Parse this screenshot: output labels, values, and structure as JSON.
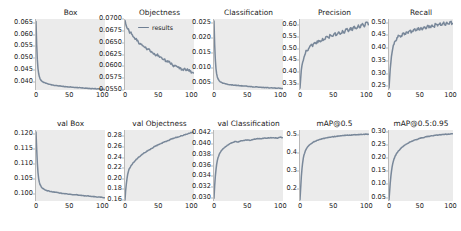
{
  "figure": {
    "rows": 2,
    "cols": 5,
    "background": "#ffffff",
    "axes_background": "#ebebeb",
    "line_color": "#6f7f93",
    "legend": {
      "label": "results",
      "panel": "Objectness"
    }
  },
  "chart_data": [
    {
      "type": "line",
      "title": "Box",
      "xlabel": "",
      "ylabel": "",
      "xlim": [
        0,
        104
      ],
      "ylim": [
        0.0368,
        0.0665
      ],
      "xticks": [
        0,
        50,
        100
      ],
      "yticks": [
        0.04,
        0.045,
        0.05,
        0.055,
        0.06,
        0.065
      ],
      "ytick_labels": [
        "0.040",
        "0.045",
        "0.050",
        "0.055",
        "0.060",
        "0.065"
      ],
      "grid": false,
      "legend_position": "none",
      "series": [
        {
          "name": "results",
          "x": [
            0,
            1,
            2,
            3,
            4,
            5,
            6,
            8,
            10,
            12,
            15,
            20,
            25,
            30,
            35,
            40,
            45,
            50,
            55,
            60,
            65,
            70,
            75,
            80,
            85,
            90,
            95,
            100,
            103
          ],
          "values": [
            0.0655,
            0.056,
            0.0495,
            0.0458,
            0.0437,
            0.0424,
            0.0416,
            0.0407,
            0.0402,
            0.0399,
            0.0396,
            0.0392,
            0.0389,
            0.0387,
            0.0385,
            0.0383,
            0.0382,
            0.0381,
            0.038,
            0.0379,
            0.0378,
            0.0377,
            0.0376,
            0.0375,
            0.0374,
            0.0373,
            0.0372,
            0.0371,
            0.037
          ]
        }
      ]
    },
    {
      "type": "line",
      "title": "Objectness",
      "xlabel": "",
      "ylabel": "",
      "xlim": [
        0,
        104
      ],
      "ylim": [
        0.055,
        0.07
      ],
      "xticks": [
        0,
        50,
        100
      ],
      "yticks": [
        0.055,
        0.0575,
        0.06,
        0.0625,
        0.065,
        0.0675,
        0.07
      ],
      "ytick_labels": [
        "0.0550",
        "0.0575",
        "0.0600",
        "0.0625",
        "0.0650",
        "0.0675",
        "0.0700"
      ],
      "grid": false,
      "legend_position": "upper right",
      "series": [
        {
          "name": "results",
          "x": [
            0,
            2,
            4,
            6,
            8,
            10,
            12,
            14,
            16,
            18,
            20,
            23,
            26,
            29,
            32,
            35,
            38,
            41,
            44,
            47,
            50,
            53,
            56,
            59,
            62,
            65,
            68,
            71,
            74,
            77,
            80,
            83,
            86,
            89,
            92,
            95,
            98,
            101,
            103
          ],
          "values": [
            0.0697,
            0.0685,
            0.0679,
            0.0675,
            0.0671,
            0.0668,
            0.0663,
            0.0661,
            0.0657,
            0.0654,
            0.0652,
            0.0648,
            0.0644,
            0.0641,
            0.0638,
            0.0636,
            0.0632,
            0.0629,
            0.0627,
            0.0624,
            0.0622,
            0.062,
            0.0616,
            0.0615,
            0.0611,
            0.0609,
            0.0607,
            0.0604,
            0.0602,
            0.0601,
            0.0598,
            0.0597,
            0.0594,
            0.0595,
            0.0591,
            0.0592,
            0.0589,
            0.0587,
            0.0586
          ]
        }
      ]
    },
    {
      "type": "line",
      "title": "Classification",
      "xlabel": "",
      "ylabel": "",
      "xlim": [
        0,
        104
      ],
      "ylim": [
        0.0028,
        0.0262
      ],
      "xticks": [
        0,
        50,
        100
      ],
      "yticks": [
        0.005,
        0.01,
        0.015,
        0.02,
        0.025
      ],
      "ytick_labels": [
        "0.005",
        "0.010",
        "0.015",
        "0.020",
        "0.025"
      ],
      "grid": false,
      "legend_position": "none",
      "series": [
        {
          "name": "results",
          "x": [
            0,
            1,
            2,
            3,
            4,
            5,
            6,
            8,
            10,
            12,
            15,
            20,
            25,
            30,
            35,
            40,
            45,
            50,
            55,
            60,
            65,
            70,
            75,
            80,
            85,
            90,
            95,
            100,
            103
          ],
          "values": [
            0.0255,
            0.0178,
            0.0128,
            0.0098,
            0.0081,
            0.0071,
            0.0065,
            0.0058,
            0.0054,
            0.0052,
            0.005,
            0.0047,
            0.0045,
            0.0044,
            0.0043,
            0.0042,
            0.0041,
            0.004,
            0.0039,
            0.0038,
            0.0038,
            0.0037,
            0.0036,
            0.0036,
            0.0035,
            0.0035,
            0.0034,
            0.0034,
            0.0033
          ]
        }
      ]
    },
    {
      "type": "line",
      "title": "Precision",
      "xlabel": "",
      "ylabel": "",
      "xlim": [
        0,
        104
      ],
      "ylim": [
        0.325,
        0.625
      ],
      "xticks": [
        0,
        50,
        100
      ],
      "yticks": [
        0.35,
        0.4,
        0.45,
        0.5,
        0.55,
        0.6
      ],
      "ytick_labels": [
        "0.35",
        "0.40",
        "0.45",
        "0.50",
        "0.55",
        "0.60"
      ],
      "grid": false,
      "legend_position": "none",
      "series": [
        {
          "name": "results",
          "x": [
            0,
            2,
            4,
            6,
            8,
            10,
            13,
            16,
            19,
            22,
            25,
            28,
            31,
            34,
            37,
            40,
            43,
            46,
            49,
            52,
            55,
            58,
            61,
            64,
            67,
            70,
            73,
            76,
            79,
            82,
            85,
            88,
            91,
            94,
            97,
            100,
            103
          ],
          "values": [
            0.333,
            0.41,
            0.442,
            0.463,
            0.478,
            0.492,
            0.5,
            0.513,
            0.509,
            0.525,
            0.521,
            0.534,
            0.529,
            0.543,
            0.538,
            0.551,
            0.546,
            0.557,
            0.552,
            0.564,
            0.556,
            0.57,
            0.561,
            0.576,
            0.566,
            0.582,
            0.572,
            0.588,
            0.577,
            0.594,
            0.584,
            0.6,
            0.589,
            0.606,
            0.592,
            0.612,
            0.601
          ]
        }
      ]
    },
    {
      "type": "line",
      "title": "Recall",
      "xlabel": "",
      "ylabel": "",
      "xlim": [
        0,
        104
      ],
      "ylim": [
        0.235,
        0.515
      ],
      "xticks": [
        0,
        50,
        100
      ],
      "yticks": [
        0.25,
        0.3,
        0.35,
        0.4,
        0.45,
        0.5
      ],
      "ytick_labels": [
        "0.25",
        "0.30",
        "0.35",
        "0.40",
        "0.45",
        "0.50"
      ],
      "grid": false,
      "legend_position": "none",
      "series": [
        {
          "name": "results",
          "x": [
            0,
            2,
            4,
            6,
            8,
            10,
            13,
            16,
            19,
            22,
            25,
            28,
            31,
            34,
            37,
            40,
            43,
            46,
            49,
            52,
            55,
            58,
            61,
            64,
            67,
            70,
            73,
            76,
            79,
            82,
            85,
            88,
            91,
            94,
            97,
            100,
            103
          ],
          "values": [
            0.243,
            0.318,
            0.368,
            0.397,
            0.414,
            0.428,
            0.441,
            0.449,
            0.444,
            0.458,
            0.453,
            0.464,
            0.459,
            0.47,
            0.465,
            0.474,
            0.469,
            0.478,
            0.473,
            0.481,
            0.476,
            0.484,
            0.479,
            0.488,
            0.482,
            0.491,
            0.485,
            0.494,
            0.488,
            0.496,
            0.49,
            0.499,
            0.493,
            0.502,
            0.495,
            0.504,
            0.497
          ]
        }
      ]
    },
    {
      "type": "line",
      "title": "val Box",
      "xlabel": "",
      "ylabel": "",
      "xlim": [
        0,
        104
      ],
      "ylim": [
        0.0975,
        0.1212
      ],
      "xticks": [
        0,
        50,
        100
      ],
      "yticks": [
        0.1,
        0.105,
        0.11,
        0.115,
        0.12
      ],
      "ytick_labels": [
        "0.100",
        "0.105",
        "0.110",
        "0.115",
        "0.120"
      ],
      "grid": false,
      "legend_position": "none",
      "series": [
        {
          "name": "results",
          "x": [
            0,
            1,
            2,
            3,
            4,
            5,
            6,
            8,
            10,
            13,
            16,
            20,
            25,
            30,
            35,
            40,
            45,
            50,
            55,
            60,
            65,
            70,
            75,
            80,
            85,
            90,
            95,
            100,
            103
          ],
          "values": [
            0.1205,
            0.115,
            0.1102,
            0.107,
            0.105,
            0.1038,
            0.103,
            0.1022,
            0.1017,
            0.1013,
            0.101,
            0.1008,
            0.1005,
            0.1004,
            0.1002,
            0.1,
            0.0999,
            0.0998,
            0.0996,
            0.0996,
            0.0994,
            0.0993,
            0.0992,
            0.0991,
            0.099,
            0.0989,
            0.0988,
            0.0987,
            0.0986
          ]
        }
      ]
    },
    {
      "type": "line",
      "title": "val Objectness",
      "xlabel": "",
      "ylabel": "",
      "xlim": [
        0,
        104
      ],
      "ylim": [
        0.158,
        0.292
      ],
      "xticks": [
        0,
        50,
        100
      ],
      "yticks": [
        0.16,
        0.18,
        0.2,
        0.22,
        0.24,
        0.26,
        0.28
      ],
      "ytick_labels": [
        "0.16",
        "0.18",
        "0.20",
        "0.22",
        "0.24",
        "0.26",
        "0.28"
      ],
      "grid": false,
      "legend_position": "none",
      "series": [
        {
          "name": "results",
          "x": [
            0,
            1,
            2,
            3,
            4,
            5,
            6,
            8,
            10,
            13,
            16,
            20,
            24,
            28,
            32,
            36,
            40,
            45,
            50,
            55,
            60,
            65,
            70,
            75,
            80,
            85,
            90,
            95,
            100,
            103
          ],
          "values": [
            0.16,
            0.178,
            0.19,
            0.2,
            0.208,
            0.213,
            0.218,
            0.222,
            0.226,
            0.231,
            0.235,
            0.24,
            0.244,
            0.248,
            0.251,
            0.254,
            0.257,
            0.261,
            0.264,
            0.267,
            0.27,
            0.272,
            0.275,
            0.277,
            0.279,
            0.281,
            0.283,
            0.285,
            0.287,
            0.288
          ]
        }
      ]
    },
    {
      "type": "line",
      "title": "val Classification",
      "xlabel": "",
      "ylabel": "",
      "xlim": [
        0,
        104
      ],
      "ylim": [
        0.0295,
        0.0425
      ],
      "xticks": [
        0,
        50,
        100
      ],
      "yticks": [
        0.03,
        0.032,
        0.034,
        0.036,
        0.038,
        0.04,
        0.042
      ],
      "ytick_labels": [
        "0.030",
        "0.032",
        "0.034",
        "0.036",
        "0.038",
        "0.040",
        "0.042"
      ],
      "grid": false,
      "legend_position": "none",
      "series": [
        {
          "name": "results",
          "x": [
            0,
            1,
            2,
            3,
            4,
            5,
            6,
            8,
            10,
            13,
            16,
            20,
            24,
            28,
            32,
            36,
            40,
            45,
            50,
            55,
            60,
            65,
            70,
            75,
            80,
            85,
            90,
            95,
            100,
            103
          ],
          "values": [
            0.03,
            0.0323,
            0.034,
            0.0352,
            0.0362,
            0.0369,
            0.0374,
            0.0381,
            0.0385,
            0.039,
            0.0393,
            0.0397,
            0.04,
            0.0402,
            0.0404,
            0.0403,
            0.0405,
            0.0406,
            0.0407,
            0.0406,
            0.0408,
            0.0409,
            0.0409,
            0.041,
            0.041,
            0.0411,
            0.0411,
            0.041,
            0.0412,
            0.0411
          ]
        }
      ]
    },
    {
      "type": "line",
      "title": "mAP@0.5",
      "xlabel": "",
      "ylabel": "",
      "xlim": [
        0,
        104
      ],
      "ylim": [
        0.135,
        0.525
      ],
      "xticks": [
        0,
        50,
        100
      ],
      "yticks": [
        0.2,
        0.3,
        0.4,
        0.5
      ],
      "ytick_labels": [
        "0.2",
        "0.3",
        "0.4",
        "0.5"
      ],
      "grid": false,
      "legend_position": "none",
      "series": [
        {
          "name": "results",
          "x": [
            0,
            1,
            2,
            3,
            4,
            5,
            6,
            8,
            10,
            13,
            16,
            20,
            25,
            30,
            35,
            40,
            45,
            50,
            55,
            60,
            65,
            70,
            75,
            80,
            85,
            90,
            95,
            100,
            103
          ],
          "values": [
            0.142,
            0.205,
            0.268,
            0.312,
            0.345,
            0.37,
            0.388,
            0.41,
            0.424,
            0.438,
            0.448,
            0.458,
            0.467,
            0.473,
            0.478,
            0.482,
            0.485,
            0.488,
            0.49,
            0.492,
            0.494,
            0.496,
            0.497,
            0.498,
            0.499,
            0.5,
            0.501,
            0.502,
            0.502
          ]
        }
      ]
    },
    {
      "type": "line",
      "title": "mAP@0.5:0.95",
      "xlabel": "",
      "ylabel": "",
      "xlim": [
        0,
        104
      ],
      "ylim": [
        0.037,
        0.307
      ],
      "xticks": [
        0,
        50,
        100
      ],
      "yticks": [
        0.05,
        0.1,
        0.15,
        0.2,
        0.25,
        0.3
      ],
      "ytick_labels": [
        "0.05",
        "0.10",
        "0.15",
        "0.20",
        "0.25",
        "0.30"
      ],
      "grid": false,
      "legend_position": "none",
      "series": [
        {
          "name": "results",
          "x": [
            0,
            1,
            2,
            3,
            4,
            5,
            6,
            8,
            10,
            13,
            16,
            20,
            25,
            30,
            35,
            40,
            45,
            50,
            55,
            60,
            65,
            70,
            75,
            80,
            85,
            90,
            95,
            100,
            103
          ],
          "values": [
            0.042,
            0.073,
            0.105,
            0.13,
            0.15,
            0.166,
            0.178,
            0.196,
            0.208,
            0.22,
            0.229,
            0.239,
            0.249,
            0.256,
            0.262,
            0.267,
            0.271,
            0.275,
            0.278,
            0.281,
            0.283,
            0.285,
            0.287,
            0.288,
            0.289,
            0.29,
            0.291,
            0.292,
            0.293
          ]
        }
      ]
    }
  ]
}
